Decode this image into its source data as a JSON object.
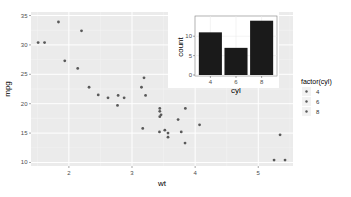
{
  "chart_data": [
    {
      "type": "scatter",
      "title": "",
      "xlabel": "wt",
      "ylabel": "mpg",
      "xlim": [
        1.4,
        5.55
      ],
      "ylim": [
        9.4,
        35.6
      ],
      "xticks": [
        2,
        3,
        4,
        5
      ],
      "yticks": [
        10,
        15,
        20,
        25,
        30,
        35
      ],
      "grid": true,
      "legend": {
        "title": "factor(cyl)",
        "position": "right",
        "entries": [
          "4",
          "6",
          "8"
        ]
      },
      "point_color": "#595959",
      "points": [
        {
          "wt": 1.513,
          "mpg": 30.4
        },
        {
          "wt": 1.615,
          "mpg": 30.4
        },
        {
          "wt": 1.835,
          "mpg": 33.9
        },
        {
          "wt": 1.935,
          "mpg": 27.3
        },
        {
          "wt": 2.14,
          "mpg": 26.0
        },
        {
          "wt": 2.2,
          "mpg": 32.4
        },
        {
          "wt": 2.32,
          "mpg": 22.8
        },
        {
          "wt": 2.465,
          "mpg": 21.5
        },
        {
          "wt": 2.62,
          "mpg": 21.0
        },
        {
          "wt": 2.77,
          "mpg": 19.7
        },
        {
          "wt": 2.78,
          "mpg": 21.4
        },
        {
          "wt": 2.875,
          "mpg": 21.0
        },
        {
          "wt": 3.15,
          "mpg": 22.8
        },
        {
          "wt": 3.17,
          "mpg": 15.8
        },
        {
          "wt": 3.19,
          "mpg": 24.4
        },
        {
          "wt": 3.215,
          "mpg": 21.4
        },
        {
          "wt": 3.435,
          "mpg": 15.2
        },
        {
          "wt": 3.44,
          "mpg": 18.7
        },
        {
          "wt": 3.44,
          "mpg": 19.2
        },
        {
          "wt": 3.44,
          "mpg": 17.8
        },
        {
          "wt": 3.46,
          "mpg": 18.1
        },
        {
          "wt": 3.52,
          "mpg": 15.5
        },
        {
          "wt": 3.57,
          "mpg": 14.3
        },
        {
          "wt": 3.57,
          "mpg": 15.0
        },
        {
          "wt": 3.73,
          "mpg": 17.3
        },
        {
          "wt": 3.78,
          "mpg": 15.2
        },
        {
          "wt": 3.84,
          "mpg": 13.3
        },
        {
          "wt": 3.845,
          "mpg": 19.2
        },
        {
          "wt": 4.07,
          "mpg": 16.4
        },
        {
          "wt": 5.25,
          "mpg": 10.4
        },
        {
          "wt": 5.345,
          "mpg": 14.7
        },
        {
          "wt": 5.424,
          "mpg": 10.4
        }
      ]
    },
    {
      "type": "bar",
      "title": "",
      "xlabel": "cyl",
      "ylabel": "count",
      "categories": [
        "4",
        "6",
        "8"
      ],
      "values": [
        11,
        7,
        14
      ],
      "ylim": [
        0,
        14.7
      ],
      "yticks": [
        0,
        5,
        10
      ],
      "grid": true,
      "bar_color": "#1a1a1a"
    }
  ]
}
